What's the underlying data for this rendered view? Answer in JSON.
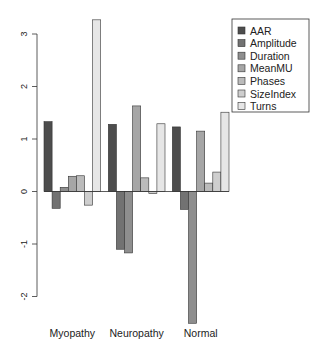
{
  "chart_data": {
    "type": "bar",
    "title": "",
    "xlabel": "",
    "ylabel": "",
    "ylim": [
      -2.3,
      3.4
    ],
    "yticks": [
      -2,
      -1,
      0,
      1,
      2,
      3
    ],
    "grid": false,
    "legend_position": "top-right",
    "categories": [
      "Myopathy",
      "Neuropathy",
      "Normal"
    ],
    "series": [
      {
        "name": "AAR",
        "color": "#4D4D4D",
        "values": [
          1.33,
          1.28,
          1.23
        ]
      },
      {
        "name": "Amplitude",
        "color": "#727272",
        "values": [
          -0.32,
          -1.1,
          -0.34
        ]
      },
      {
        "name": "Duration",
        "color": "#8E8E8E",
        "values": [
          0.08,
          -1.17,
          -2.51
        ]
      },
      {
        "name": "MeanMU",
        "color": "#A6A6A6",
        "values": [
          0.29,
          1.63,
          1.15
        ]
      },
      {
        "name": "Phases",
        "color": "#BBBBBB",
        "values": [
          0.3,
          0.26,
          0.16
        ]
      },
      {
        "name": "SizeIndex",
        "color": "#CECECE",
        "values": [
          -0.26,
          -0.04,
          0.37
        ]
      },
      {
        "name": "Turns",
        "color": "#E6E6E6",
        "values": [
          3.27,
          1.29,
          1.51
        ]
      }
    ]
  },
  "layout": {
    "zero_y": 191.5,
    "px_per_unit": 52.5,
    "axis_x": 37,
    "group_starts": [
      44,
      108.3,
      172.3
    ],
    "bar_width": 8.1,
    "cat_label_y": 337,
    "legend": {
      "x": 232,
      "y": 19,
      "w": 77,
      "h": 93,
      "row_h": 12.6,
      "first_row_y": 31
    }
  }
}
